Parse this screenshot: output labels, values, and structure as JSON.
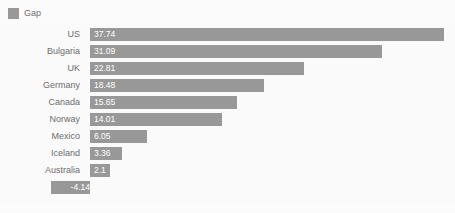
{
  "legend": {
    "position": "top-left",
    "entries": [
      {
        "label": "Gap",
        "color": "#989898",
        "swatch_icon": "legend-swatch-icon"
      }
    ]
  },
  "colors": {
    "bar": "#989898",
    "plot_background": "#fafafa",
    "page_background": "#fbfbfb",
    "category_label": "#6d6d6d",
    "value_label": "#ffffff"
  },
  "chart_data": {
    "type": "bar",
    "orientation": "horizontal",
    "title": "",
    "subtitle": "",
    "xlabel": "",
    "ylabel": "",
    "grid": false,
    "legend_position": "top-left",
    "categories": [
      "US",
      "Bulgaria",
      "UK",
      "Germany",
      "Canada",
      "Norway",
      "Mexico",
      "Iceland",
      "Australia",
      "Brazil"
    ],
    "series": [
      {
        "name": "Gap",
        "color": "#989898",
        "values": [
          37.74,
          31.09,
          22.81,
          18.48,
          15.65,
          14.01,
          6.05,
          3.36,
          2.1,
          -4.14
        ],
        "value_labels": [
          "37.74",
          "31.09",
          "22.81",
          "18.48",
          "15.65",
          "14.01",
          "6.05",
          "3.36",
          "2.1",
          "-4.14"
        ]
      }
    ],
    "xlim": [
      -4.14,
      37.74
    ],
    "zero_baseline": 0,
    "tick_labels": [],
    "annotations": []
  }
}
